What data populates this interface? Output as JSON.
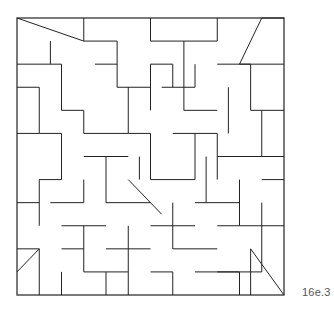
{
  "figure": {
    "label": "16e.3",
    "stroke": "#222222",
    "background": "#ffffff",
    "frame": {
      "x": 17,
      "y": 18,
      "w": 267,
      "h": 277
    },
    "grid": {
      "cols": 24,
      "rows": 24
    },
    "segments": [
      [
        0,
        0,
        6,
        2
      ],
      [
        6,
        0,
        6,
        2
      ],
      [
        6,
        2,
        9,
        2
      ],
      [
        9,
        2,
        9,
        6
      ],
      [
        9,
        6,
        12,
        6
      ],
      [
        12,
        0,
        12,
        2
      ],
      [
        12,
        2,
        18,
        2
      ],
      [
        18,
        2,
        18,
        0
      ],
      [
        0,
        4,
        4,
        4
      ],
      [
        4,
        4,
        4,
        8
      ],
      [
        4,
        8,
        6,
        8
      ],
      [
        6,
        8,
        6,
        10
      ],
      [
        6,
        10,
        10,
        10
      ],
      [
        10,
        6,
        10,
        10
      ],
      [
        12,
        4,
        12,
        8
      ],
      [
        12,
        4,
        14,
        4
      ],
      [
        14,
        4,
        14,
        6
      ],
      [
        15,
        2,
        15,
        8
      ],
      [
        15,
        8,
        18,
        8
      ],
      [
        18,
        4,
        21,
        4
      ],
      [
        21,
        4,
        21,
        8
      ],
      [
        21,
        8,
        24,
        8
      ],
      [
        24,
        0,
        22,
        0
      ],
      [
        22,
        0,
        20,
        4
      ],
      [
        20,
        4,
        24,
        4
      ],
      [
        0,
        6,
        2,
        6
      ],
      [
        2,
        6,
        2,
        10
      ],
      [
        2,
        10,
        4,
        10
      ],
      [
        4,
        10,
        4,
        14
      ],
      [
        4,
        14,
        2,
        14
      ],
      [
        2,
        14,
        2,
        18
      ],
      [
        0,
        10,
        2,
        10
      ],
      [
        6,
        12,
        10,
        12
      ],
      [
        8,
        12,
        8,
        16
      ],
      [
        8,
        16,
        12,
        16
      ],
      [
        10,
        10,
        12,
        10
      ],
      [
        12,
        10,
        12,
        14
      ],
      [
        12,
        14,
        16,
        14
      ],
      [
        16,
        10,
        16,
        14
      ],
      [
        14,
        10,
        18,
        10
      ],
      [
        18,
        10,
        18,
        14
      ],
      [
        18,
        12,
        22,
        12
      ],
      [
        22,
        8,
        22,
        12
      ],
      [
        22,
        12,
        24,
        12
      ],
      [
        20,
        14,
        20,
        18
      ],
      [
        20,
        18,
        24,
        18
      ],
      [
        0,
        20,
        2,
        20
      ],
      [
        0,
        22,
        2,
        20
      ],
      [
        2,
        20,
        2,
        24
      ],
      [
        4,
        18,
        8,
        18
      ],
      [
        6,
        18,
        6,
        22
      ],
      [
        6,
        22,
        10,
        22
      ],
      [
        10,
        18,
        10,
        24
      ],
      [
        8,
        20,
        12,
        20
      ],
      [
        12,
        18,
        16,
        18
      ],
      [
        14,
        16,
        14,
        20
      ],
      [
        14,
        20,
        18,
        20
      ],
      [
        16,
        22,
        20,
        22
      ],
      [
        20,
        22,
        20,
        24
      ],
      [
        16,
        16,
        20,
        16
      ],
      [
        18,
        22,
        22,
        22
      ],
      [
        22,
        18,
        22,
        22
      ],
      [
        21,
        20,
        24,
        24
      ],
      [
        21,
        20,
        21,
        24
      ],
      [
        3,
        16,
        6,
        16
      ],
      [
        6,
        14,
        6,
        16
      ],
      [
        8,
        22,
        8,
        24
      ],
      [
        12,
        22,
        14,
        22
      ],
      [
        14,
        22,
        14,
        24
      ],
      [
        4,
        22,
        4,
        24
      ],
      [
        11,
        12,
        11,
        14
      ],
      [
        17,
        12,
        17,
        16
      ],
      [
        19,
        6,
        19,
        10
      ],
      [
        13,
        6,
        16,
        6
      ],
      [
        3,
        2,
        3,
        4
      ],
      [
        7,
        4,
        9,
        4
      ],
      [
        16,
        4,
        16,
        6
      ],
      [
        10,
        14,
        13,
        17
      ],
      [
        0,
        16,
        2,
        16
      ],
      [
        4,
        20,
        6,
        20
      ],
      [
        22,
        14,
        24,
        14
      ],
      [
        22,
        16,
        22,
        18
      ],
      [
        18,
        18,
        20,
        18
      ]
    ]
  }
}
